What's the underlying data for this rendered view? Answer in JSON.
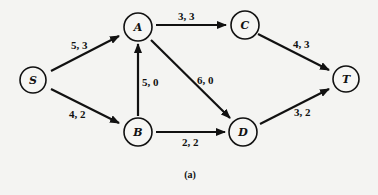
{
  "diagram": {
    "type": "flow-network",
    "caption": "(a)",
    "nodes": [
      {
        "id": "S",
        "label": "S",
        "x": 33,
        "y": 80
      },
      {
        "id": "A",
        "label": "A",
        "x": 138,
        "y": 27
      },
      {
        "id": "C",
        "label": "C",
        "x": 245,
        "y": 25
      },
      {
        "id": "T",
        "label": "T",
        "x": 346,
        "y": 79
      },
      {
        "id": "B",
        "label": "B",
        "x": 138,
        "y": 132
      },
      {
        "id": "D",
        "label": "D",
        "x": 243,
        "y": 132
      }
    ],
    "edges": [
      {
        "from": "S",
        "to": "A",
        "label": "5, 3",
        "capacity": 5,
        "flow": 3
      },
      {
        "from": "S",
        "to": "B",
        "label": "4, 2",
        "capacity": 4,
        "flow": 2
      },
      {
        "from": "B",
        "to": "A",
        "label": "5, 0",
        "capacity": 5,
        "flow": 0
      },
      {
        "from": "A",
        "to": "C",
        "label": "3, 3",
        "capacity": 3,
        "flow": 3
      },
      {
        "from": "A",
        "to": "D",
        "label": "6, 0",
        "capacity": 6,
        "flow": 0
      },
      {
        "from": "B",
        "to": "D",
        "label": "2, 2",
        "capacity": 2,
        "flow": 2
      },
      {
        "from": "C",
        "to": "T",
        "label": "4, 3",
        "capacity": 4,
        "flow": 3
      },
      {
        "from": "D",
        "to": "T",
        "label": "3, 2",
        "capacity": 3,
        "flow": 2
      }
    ]
  }
}
